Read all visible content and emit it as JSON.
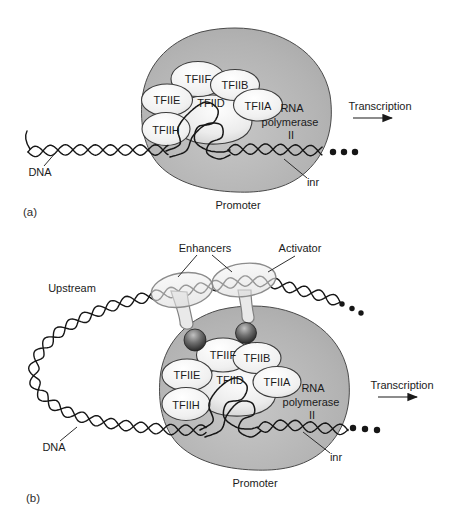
{
  "colors": {
    "background": "#ffffff",
    "polymerase_fill": "#b3b3b3",
    "factor_fill": "#f0f0f0",
    "tfiid_fill": "#ececec",
    "activator_fill": "#e9e9e9",
    "coactivator_fill": "#4a4a4a",
    "dna_color": "#161616",
    "text_color": "#1b1b1b"
  },
  "panel_a": {
    "tag": "(a)",
    "factors": {
      "tfiif": "TFIIF",
      "tfiib": "TFIIB",
      "tfiie": "TFIIE",
      "tfiid": "TFIID",
      "tfiia": "TFIIA",
      "tfiih": "TFIIH"
    },
    "polymerase": {
      "line1": "RNA",
      "line2": "polymerase",
      "line3": "II"
    },
    "labels": {
      "transcription": "Transcription",
      "dna": "DNA",
      "inr": "inr",
      "promoter": "Promoter"
    }
  },
  "panel_b": {
    "tag": "(b)",
    "factors": {
      "tfiif": "TFIIF",
      "tfiib": "TFIIB",
      "tfiie": "TFIIE",
      "tfiid": "TFIID",
      "tfiia": "TFIIA",
      "tfiih": "TFIIH"
    },
    "polymerase": {
      "line1": "RNA",
      "line2": "polymerase",
      "line3": "II"
    },
    "labels": {
      "transcription": "Transcription",
      "dna": "DNA",
      "inr": "inr",
      "promoter": "Promoter",
      "enhancers": "Enhancers",
      "activator": "Activator",
      "upstream": "Upstream"
    }
  }
}
